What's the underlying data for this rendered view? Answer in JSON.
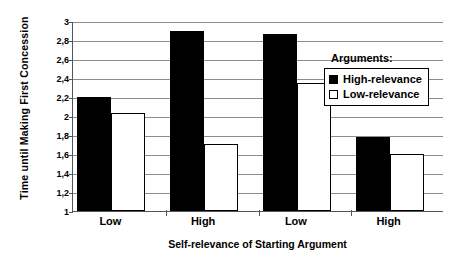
{
  "chart_data": {
    "type": "bar",
    "title": "",
    "xlabel": "Self-relevance of Starting Argument",
    "ylabel": "Time until Making First Concession",
    "categories": [
      "Low",
      "High",
      "Low",
      "High"
    ],
    "series": [
      {
        "name": "High-relevance",
        "values": [
          2.2,
          2.9,
          2.86,
          1.78
        ],
        "color": "#000000"
      },
      {
        "name": "Low-relevance",
        "values": [
          2.03,
          1.71,
          2.35,
          1.6
        ],
        "color": "#ffffff"
      }
    ],
    "ylim": [
      1,
      3
    ],
    "ytick_step": 0.2,
    "ytick_labels": [
      "1",
      "1,2",
      "1,4",
      "1,6",
      "1,8",
      "2",
      "2,2",
      "2,4",
      "2,6",
      "2,8",
      "3"
    ],
    "ytick_values": [
      1,
      1.2,
      1.4,
      1.6,
      1.8,
      2.0,
      2.2,
      2.4,
      2.6,
      2.8,
      3.0
    ],
    "grid": true,
    "grid_axis": "y",
    "legend": {
      "title": "Arguments:",
      "position": "inside-upper-right",
      "entries": [
        {
          "label": "High-relevance",
          "marker": "filled-square",
          "color": "#000000"
        },
        {
          "label": "Low-relevance",
          "marker": "open-square",
          "color": "#ffffff"
        }
      ]
    }
  }
}
